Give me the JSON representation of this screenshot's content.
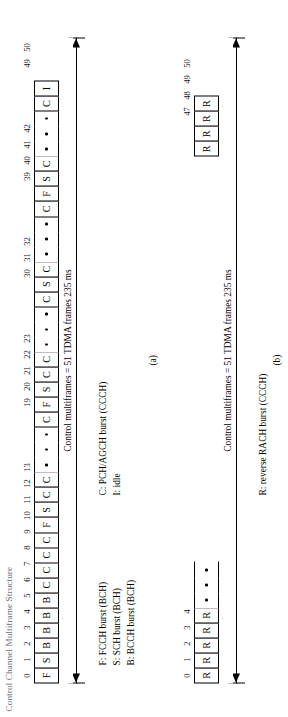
{
  "figure": {
    "title": "Control Channel Multiframe Structure",
    "panels": [
      {
        "id": "a",
        "sub_label": "(a)",
        "span_label": "Control multiframes = 51 TDMA frames 235 ms",
        "index_labels": [
          "0",
          "1",
          "2",
          "3",
          "4",
          "5",
          "6",
          "7",
          "8",
          "9",
          "10",
          "11",
          "12",
          "13",
          "19",
          "20",
          "21",
          "22",
          "23",
          "30",
          "31",
          "32",
          "39",
          "40",
          "41",
          "42",
          "49",
          "50"
        ],
        "cells": [
          {
            "n": "0",
            "v": "F"
          },
          {
            "n": "1",
            "v": "S"
          },
          {
            "n": "2",
            "v": "B"
          },
          {
            "n": "3",
            "v": "B"
          },
          {
            "n": "4",
            "v": "B"
          },
          {
            "n": "5",
            "v": "B"
          },
          {
            "n": "6",
            "v": "C"
          },
          {
            "n": "7",
            "v": "C"
          },
          {
            "n": "8",
            "v": "C"
          },
          {
            "n": "9",
            "v": "C"
          },
          {
            "n": "10",
            "v": "F"
          },
          {
            "n": "11",
            "v": "S"
          },
          {
            "n": "12",
            "v": "C"
          },
          {
            "n": "13",
            "v": "C"
          },
          {
            "n": "",
            "v": "."
          },
          {
            "n": "",
            "v": "."
          },
          {
            "n": "",
            "v": "."
          },
          {
            "n": "19",
            "v": "C"
          },
          {
            "n": "20",
            "v": "F"
          },
          {
            "n": "21",
            "v": "S"
          },
          {
            "n": "22",
            "v": "C"
          },
          {
            "n": "23",
            "v": "C"
          },
          {
            "n": "",
            "v": "."
          },
          {
            "n": "",
            "v": "."
          },
          {
            "n": "",
            "v": "."
          },
          {
            "n": "30",
            "v": "C"
          },
          {
            "n": "31",
            "v": "S"
          },
          {
            "n": "32",
            "v": "C"
          },
          {
            "n": "",
            "v": "."
          },
          {
            "n": "",
            "v": "."
          },
          {
            "n": "",
            "v": "."
          },
          {
            "n": "39",
            "v": "C"
          },
          {
            "n": "40",
            "v": "F"
          },
          {
            "n": "41",
            "v": "S"
          },
          {
            "n": "42",
            "v": "C"
          },
          {
            "n": "",
            "v": "."
          },
          {
            "n": "",
            "v": "."
          },
          {
            "n": "",
            "v": "."
          },
          {
            "n": "49",
            "v": "C"
          },
          {
            "n": "50",
            "v": "I"
          }
        ],
        "legend_left": "F: FCCH burst (BCH)\nS: SCH burst (BCH)\nB: BCCH burst (BCH)",
        "legend_right": "C: PCH/AGCH burst (CCCH)\nI: idle"
      },
      {
        "id": "b",
        "sub_label": "(b)",
        "span_label": "Control multiframes = 51 TDMA frames 235 ms",
        "index_labels": [
          "0",
          "1",
          "2",
          "3",
          "4",
          "47",
          "48",
          "49",
          "50"
        ],
        "cells": [
          {
            "n": "0",
            "v": "R"
          },
          {
            "n": "1",
            "v": "R"
          },
          {
            "n": "2",
            "v": "R"
          },
          {
            "n": "3",
            "v": "R"
          },
          {
            "n": "4",
            "v": "R"
          },
          {
            "n": "",
            "v": "."
          },
          {
            "n": "",
            "v": "."
          },
          {
            "n": "",
            "v": "."
          },
          {
            "n": "",
            "v": " "
          },
          {
            "n": "",
            "v": " "
          },
          {
            "n": "",
            "v": " "
          },
          {
            "n": "",
            "v": " "
          },
          {
            "n": "",
            "v": " "
          },
          {
            "n": "",
            "v": " "
          },
          {
            "n": "",
            "v": " "
          },
          {
            "n": "",
            "v": " "
          },
          {
            "n": "",
            "v": " "
          },
          {
            "n": "",
            "v": " "
          },
          {
            "n": "",
            "v": " "
          },
          {
            "n": "",
            "v": " "
          },
          {
            "n": "",
            "v": " "
          },
          {
            "n": "",
            "v": " "
          },
          {
            "n": "",
            "v": " "
          },
          {
            "n": "",
            "v": " "
          },
          {
            "n": "",
            "v": " "
          },
          {
            "n": "",
            "v": " "
          },
          {
            "n": "",
            "v": " "
          },
          {
            "n": "",
            "v": " "
          },
          {
            "n": "",
            "v": " "
          },
          {
            "n": "",
            "v": " "
          },
          {
            "n": "",
            "v": " "
          },
          {
            "n": "",
            "v": " "
          },
          {
            "n": "",
            "v": " "
          },
          {
            "n": "",
            "v": " "
          },
          {
            "n": "",
            "v": " "
          },
          {
            "n": "47",
            "v": "R"
          },
          {
            "n": "48",
            "v": "R"
          },
          {
            "n": "49",
            "v": "R"
          },
          {
            "n": "50",
            "v": "R"
          }
        ],
        "legend_left": "R: reverse RACH burst (CCCH)"
      }
    ]
  }
}
